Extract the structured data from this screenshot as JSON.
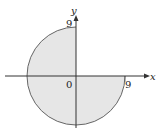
{
  "diagram": {
    "type": "region-plot",
    "radius": 9,
    "axes": {
      "x_label": "x",
      "y_label": "y"
    },
    "labels": {
      "origin": "0",
      "y_intercept": "9",
      "x_intercept": "9"
    },
    "colors": {
      "fill": "#e6e6e6",
      "stroke": "#555555",
      "axis": "#333333"
    }
  }
}
